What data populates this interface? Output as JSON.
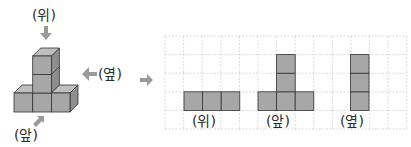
{
  "figure": {
    "view_labels": {
      "top": "(위)",
      "front": "(앞)",
      "side": "(옆)"
    },
    "colors": {
      "cube_front": "#a7a7a7",
      "cube_top": "#bfbfbf",
      "cube_side": "#8e8e8e",
      "edge": "#333333",
      "arrow": "#9a9a9a",
      "grid": "#d0d0d0"
    }
  },
  "projections": {
    "captions": [
      "(위)",
      "(앞)",
      "(옆)"
    ],
    "grid": {
      "cols": 13,
      "rows": 5
    }
  }
}
